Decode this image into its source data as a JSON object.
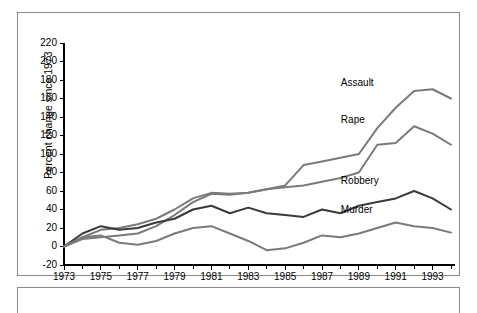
{
  "figure": {
    "ylabel": "Percent change since 1973",
    "xlabel": "Year"
  },
  "chart_data": {
    "type": "line",
    "title": "",
    "xlabel": "Year",
    "ylabel": "Percent change since 1973",
    "xlim": [
      1973,
      1994
    ],
    "ylim": [
      -20,
      220
    ],
    "ytick_step": 20,
    "xtick_step": 2,
    "grid": false,
    "legend": "inline-labels",
    "x": [
      1973,
      1974,
      1975,
      1976,
      1977,
      1978,
      1979,
      1980,
      1981,
      1982,
      1983,
      1984,
      1985,
      1986,
      1987,
      1988,
      1989,
      1990,
      1991,
      1992,
      1993,
      1994
    ],
    "yticks": [
      -20,
      0,
      20,
      40,
      60,
      80,
      100,
      120,
      140,
      160,
      180,
      200,
      220
    ],
    "xticks": [
      1973,
      1975,
      1977,
      1979,
      1981,
      1983,
      1985,
      1987,
      1989,
      1991,
      1993
    ],
    "xtick_labels": [
      "1973",
      "1975",
      "1977",
      "1979",
      "1981",
      "1983",
      "1985",
      "1987",
      "1989",
      "1991",
      "1993"
    ],
    "series": [
      {
        "name": "Assault",
        "color": "#7a7a7a",
        "label_x": 1989,
        "label_y": 176,
        "values": [
          0,
          10,
          18,
          20,
          24,
          30,
          40,
          52,
          58,
          57,
          58,
          62,
          66,
          88,
          92,
          96,
          100,
          128,
          150,
          168,
          170,
          160
        ]
      },
      {
        "name": "Rape",
        "color": "#7a7a7a",
        "label_x": 1989,
        "label_y": 136,
        "values": [
          0,
          8,
          10,
          12,
          14,
          22,
          34,
          48,
          57,
          56,
          58,
          62,
          64,
          66,
          70,
          74,
          80,
          110,
          112,
          130,
          122,
          110
        ]
      },
      {
        "name": "Robbery",
        "color": "#3a3a3a",
        "label_x": 1989,
        "label_y": 70,
        "values": [
          0,
          14,
          22,
          18,
          20,
          26,
          30,
          40,
          44,
          36,
          42,
          36,
          34,
          32,
          40,
          36,
          44,
          48,
          52,
          60,
          52,
          40
        ]
      },
      {
        "name": "Murder",
        "color": "#7a7a7a",
        "label_x": 1989,
        "label_y": 38,
        "values": [
          0,
          10,
          12,
          4,
          2,
          6,
          14,
          20,
          22,
          14,
          6,
          -4,
          -2,
          4,
          12,
          10,
          14,
          20,
          26,
          22,
          20,
          15
        ]
      }
    ]
  }
}
